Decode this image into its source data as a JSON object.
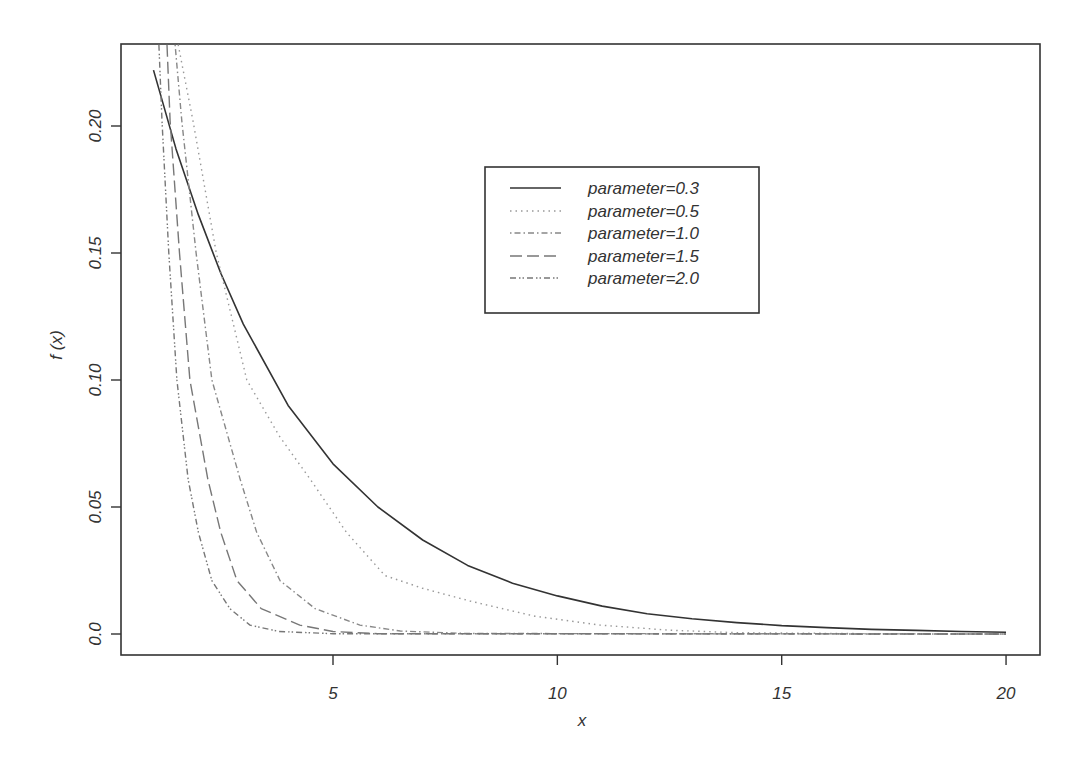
{
  "chart_data": {
    "type": "line",
    "title": "",
    "xlabel": "x",
    "ylabel": "f (x)",
    "xlim": [
      1,
      20
    ],
    "ylim": [
      0,
      0.232
    ],
    "grid": false,
    "legend_position": "top-center-right (inside plot)",
    "x_ticks": [
      5,
      10,
      15,
      20
    ],
    "x_tick_labels": [
      "5",
      "10",
      "15",
      "20"
    ],
    "y_ticks": [
      0.0,
      0.05,
      0.1,
      0.15,
      0.2
    ],
    "y_tick_labels": [
      "0.0",
      "0.05",
      "0.10",
      "0.15",
      "0.20"
    ],
    "series": [
      {
        "name": "parameter=0.3",
        "line_style": "solid",
        "color": "#333333",
        "x": [
          1,
          1.5,
          2,
          2.5,
          3,
          4,
          5,
          6,
          7,
          8,
          9,
          10,
          11,
          12,
          13,
          14,
          15,
          16,
          17,
          18,
          19,
          20
        ],
        "values": [
          0.222,
          0.191,
          0.165,
          0.142,
          0.122,
          0.09,
          0.067,
          0.05,
          0.037,
          0.027,
          0.02,
          0.015,
          0.011,
          0.008,
          0.006,
          0.0045,
          0.0033,
          0.0025,
          0.0018,
          0.0014,
          0.001,
          0.0007
        ]
      },
      {
        "name": "parameter=0.5",
        "line_style": "dotted",
        "color": "#999999",
        "x": [
          1.55,
          1.88,
          2.4,
          3.08,
          3.8,
          4.49,
          5.3,
          6.16,
          7.0,
          8.05,
          9.5,
          10.95,
          12.5,
          14,
          17,
          20
        ],
        "values": [
          0.232,
          0.202,
          0.15,
          0.1,
          0.078,
          0.061,
          0.04,
          0.023,
          0.018,
          0.013,
          0.007,
          0.0035,
          0.0015,
          0.0005,
          0.0001,
          0.0
        ]
      },
      {
        "name": "parameter=1.0",
        "line_style": "dotdash",
        "color": "#888888",
        "x": [
          1.48,
          1.63,
          1.95,
          2.3,
          2.93,
          3.3,
          3.82,
          4.6,
          5.6,
          6.5,
          8,
          20
        ],
        "values": [
          0.232,
          0.202,
          0.15,
          0.1,
          0.061,
          0.04,
          0.021,
          0.01,
          0.0035,
          0.0012,
          0.0002,
          0.0
        ]
      },
      {
        "name": "parameter=1.5",
        "line_style": "longdash",
        "color": "#777777",
        "x": [
          1.3,
          1.37,
          1.58,
          1.81,
          2.21,
          2.5,
          2.86,
          3.4,
          4.26,
          5.0,
          6.0,
          20
        ],
        "values": [
          0.232,
          0.202,
          0.15,
          0.1,
          0.061,
          0.04,
          0.021,
          0.01,
          0.0035,
          0.001,
          0.0001,
          0.0
        ]
      },
      {
        "name": "parameter=2.0",
        "line_style": "twodash",
        "color": "#777777",
        "x": [
          1.12,
          1.19,
          1.34,
          1.52,
          1.77,
          2.0,
          2.3,
          2.7,
          3.15,
          3.8,
          5.0,
          20
        ],
        "values": [
          0.232,
          0.202,
          0.15,
          0.1,
          0.061,
          0.04,
          0.021,
          0.01,
          0.0035,
          0.001,
          0.0001,
          0.0
        ]
      }
    ]
  },
  "plot": {
    "frame": {
      "left": 121,
      "top": 44,
      "right": 1040,
      "bottom": 655
    },
    "x_map": {
      "x0": 5,
      "px0": 333,
      "px_per_unit": 44.87
    },
    "y_map": {
      "y0": 0,
      "py0": 634,
      "px_per_unit": 2540
    }
  },
  "legend": {
    "items": [
      {
        "label": "parameter=0.3"
      },
      {
        "label": "parameter=0.5"
      },
      {
        "label": "parameter=1.0"
      },
      {
        "label": "parameter=1.5"
      },
      {
        "label": "parameter=2.0"
      }
    ]
  }
}
